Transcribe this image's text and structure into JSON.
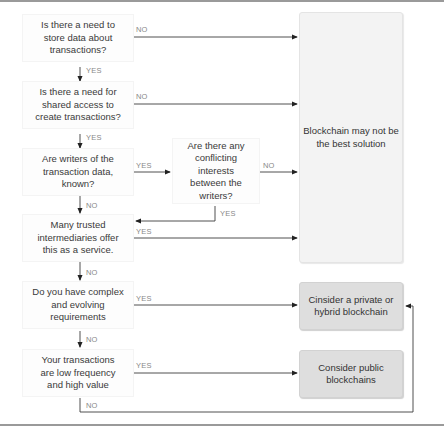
{
  "flowchart": {
    "decisions": [
      {
        "id": "q1",
        "text": "Is there a need to store data about transactions?"
      },
      {
        "id": "q2",
        "text": "Is there a need for shared access to create transactions?"
      },
      {
        "id": "q3",
        "text": "Are writers of the transaction data, known?"
      },
      {
        "id": "q4",
        "text": "Are there any conflicting interests between the writers?"
      },
      {
        "id": "q5",
        "text": "Many trusted intermediaries offer this as a service."
      },
      {
        "id": "q6",
        "text": "Do you have complex and evolving requirements"
      },
      {
        "id": "q7",
        "text": "Your transactions are low frequency and high value"
      }
    ],
    "outcomes": [
      {
        "id": "o1",
        "text": "Blockchain may not be the best solution"
      },
      {
        "id": "o2",
        "text": "Cinsider a private or hybrid blockchain"
      },
      {
        "id": "o3",
        "text": "Consider public blockchains"
      }
    ],
    "edges": [
      {
        "from": "q1",
        "to": "o1",
        "label": "NO"
      },
      {
        "from": "q1",
        "to": "q2",
        "label": "YES"
      },
      {
        "from": "q2",
        "to": "o1",
        "label": "NO"
      },
      {
        "from": "q2",
        "to": "q3",
        "label": "YES"
      },
      {
        "from": "q3",
        "to": "q4",
        "label": "YES"
      },
      {
        "from": "q3",
        "to": "q5",
        "label": "NO"
      },
      {
        "from": "q4",
        "to": "o1",
        "label": "NO"
      },
      {
        "from": "q4",
        "to": "q5",
        "label": "YES"
      },
      {
        "from": "q5",
        "to": "o1",
        "label": "YES"
      },
      {
        "from": "q5",
        "to": "q6",
        "label": "NO"
      },
      {
        "from": "q6",
        "to": "o2",
        "label": "YES"
      },
      {
        "from": "q6",
        "to": "q7",
        "label": "NO"
      },
      {
        "from": "q7",
        "to": "o3",
        "label": "YES"
      },
      {
        "from": "q7",
        "to": "o2",
        "label": "NO"
      }
    ]
  },
  "colors": {
    "line": "#3c3c3c",
    "decision_bg": "#fdfdfd",
    "outcome_light_bg": "#f3f3f3",
    "outcome_dark_bg": "#dedede",
    "rule": "#9a9a9a"
  }
}
